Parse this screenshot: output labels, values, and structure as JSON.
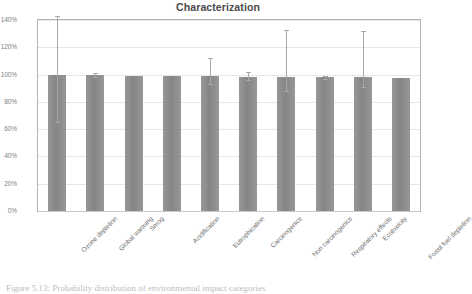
{
  "figure": {
    "caption": "Figure 5.13: Probability distribution of environmental impact categories",
    "caption_visible_fragment": "Figure 5.13: Probability distribution of ..."
  },
  "chart_data": {
    "type": "bar",
    "title": "Characterization",
    "xlabel": "",
    "ylabel": "",
    "ylim": [
      0,
      140
    ],
    "ytick_labels": [
      "0%",
      "20%",
      "40%",
      "60%",
      "80%",
      "100%",
      "120%",
      "140%"
    ],
    "ytick_values": [
      0,
      20,
      40,
      60,
      80,
      100,
      120,
      140
    ],
    "grid": true,
    "legend": null,
    "legend_position": "none",
    "bar_color": "#8c8c8c",
    "errorbar_color": "#a8a8a8",
    "units": "percent",
    "categories": [
      "Ozone depletion",
      "Global warming",
      "Smog",
      "Acidification",
      "Eutrophication",
      "Carcinogenics",
      "Non carcinogenics",
      "Respiratory effects",
      "Ecotoxicity",
      "Fossil fuel depletion"
    ],
    "values": [
      100,
      99.5,
      99,
      99,
      99,
      98.5,
      98.5,
      98,
      98,
      97.5
    ],
    "error_low": [
      65,
      98,
      99,
      99,
      93,
      96,
      88,
      97,
      91,
      97.5
    ],
    "error_high": [
      143,
      101,
      99,
      99,
      112,
      102,
      133,
      99,
      132,
      97.5
    ],
    "series": [
      {
        "name": "Characterization",
        "values": [
          100,
          99.5,
          99,
          99,
          99,
          98.5,
          98.5,
          98,
          98,
          97.5
        ]
      }
    ]
  }
}
